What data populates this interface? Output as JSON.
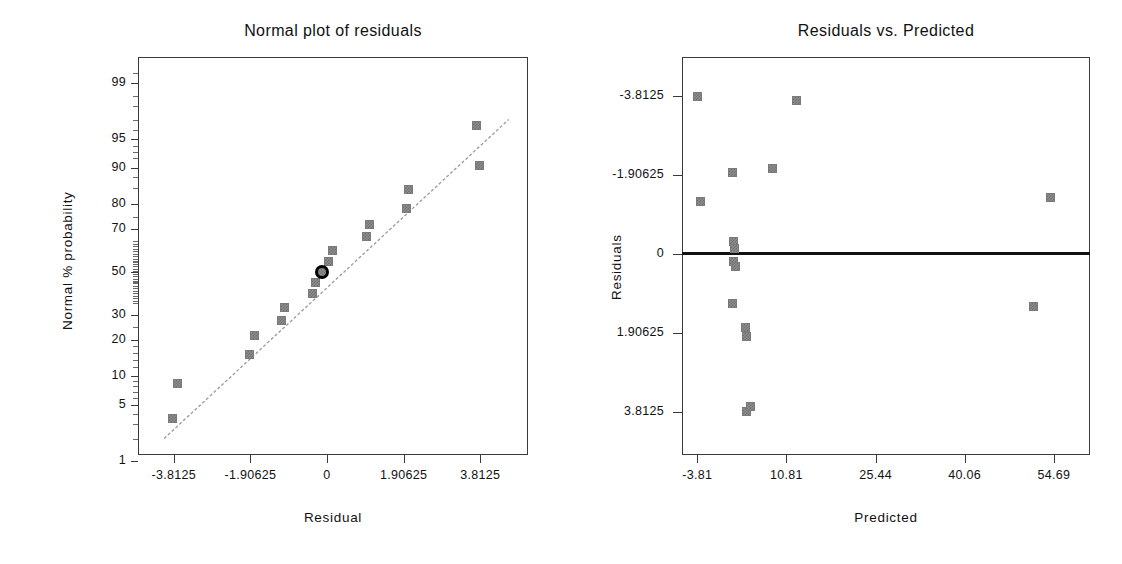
{
  "figure": {
    "width": 1122,
    "height": 564,
    "background": "#ffffff",
    "marker_color": "#8e8e8e",
    "line_color": "#999999",
    "axis_color": "#3a3a3a",
    "highlight_color": "#000000"
  },
  "chart_data": [
    {
      "type": "scatter",
      "title": "Normal plot of residuals",
      "xlabel": "Residual",
      "ylabel": "Normal % probability",
      "grid": false,
      "legend": null,
      "xlim": [
        -4.7,
        5.0
      ],
      "xticks": [
        -3.8125,
        -1.90625,
        0,
        1.90625,
        3.8125
      ],
      "xticklabels": [
        "-3.8125",
        "-1.90625",
        "0",
        "1.90625",
        "3.8125"
      ],
      "yscale": "normal-probability",
      "yticks": [
        1,
        5,
        10,
        20,
        30,
        50,
        70,
        80,
        90,
        95,
        99
      ],
      "yticklabels": [
        "1",
        "5",
        "10",
        "20",
        "30",
        "50",
        "70",
        "80",
        "90",
        "95",
        "99"
      ],
      "points": [
        {
          "x": -3.83,
          "y": 3.5
        },
        {
          "x": -3.72,
          "y": 8.5
        },
        {
          "x": -1.93,
          "y": 15.5
        },
        {
          "x": -1.8,
          "y": 21.5
        },
        {
          "x": -1.13,
          "y": 27.5
        },
        {
          "x": -1.05,
          "y": 33.0
        },
        {
          "x": -0.35,
          "y": 39.5
        },
        {
          "x": -0.28,
          "y": 45.0
        },
        {
          "x": -0.12,
          "y": 50.0
        },
        {
          "x": 0.05,
          "y": 55.0
        },
        {
          "x": 0.14,
          "y": 60.5
        },
        {
          "x": 0.98,
          "y": 67.0
        },
        {
          "x": 1.05,
          "y": 72.0
        },
        {
          "x": 1.98,
          "y": 78.5
        },
        {
          "x": 2.04,
          "y": 84.5
        },
        {
          "x": 3.8,
          "y": 90.5
        },
        {
          "x": 3.72,
          "y": 96.5
        }
      ],
      "highlighted_point": {
        "x": -0.12,
        "y": 50.0
      },
      "reference_line": {
        "x1": -4.05,
        "y1": 2.0,
        "x2": 4.52,
        "y2": 97.0,
        "style": "dashed"
      }
    },
    {
      "type": "scatter",
      "title": "Residuals vs. Predicted",
      "xlabel": "Predicted",
      "ylabel": "Residuals",
      "grid": false,
      "legend": null,
      "xlim": [
        -6.3,
        60.6
      ],
      "xticks": [
        -3.81,
        10.81,
        25.44,
        40.06,
        54.69
      ],
      "xticklabels": [
        "-3.81",
        "10.81",
        "25.44",
        "40.06",
        "54.69"
      ],
      "ylim": [
        -4.85,
        4.75
      ],
      "yticks": [
        -3.8125,
        -1.90625,
        0,
        1.90625,
        3.8125
      ],
      "yticklabels": [
        "-3.8125",
        "-1.90625",
        "0",
        "1.90625",
        "3.8125"
      ],
      "zero_line": 0,
      "points": [
        {
          "x": -3.8,
          "y": 3.8
        },
        {
          "x": -3.25,
          "y": 1.27
        },
        {
          "x": 1.95,
          "y": 1.97
        },
        {
          "x": 2.2,
          "y": 0.3
        },
        {
          "x": 2.3,
          "y": 0.14
        },
        {
          "x": 2.15,
          "y": -0.18
        },
        {
          "x": 2.45,
          "y": -0.3
        },
        {
          "x": 2.05,
          "y": -1.2
        },
        {
          "x": 4.05,
          "y": -1.78
        },
        {
          "x": 4.3,
          "y": -1.98
        },
        {
          "x": 4.35,
          "y": -3.8
        },
        {
          "x": 4.95,
          "y": -3.68
        },
        {
          "x": 8.55,
          "y": 2.05
        },
        {
          "x": 12.4,
          "y": 3.7
        },
        {
          "x": 54.1,
          "y": 1.35
        },
        {
          "x": 51.4,
          "y": -1.26
        }
      ]
    }
  ],
  "left": {
    "title": "Normal plot of residuals",
    "xlabel": "Residual",
    "ylabel": "Normal % probability",
    "xticklabels": [
      "-3.8125",
      "-1.90625",
      "0",
      "1.90625",
      "3.8125"
    ],
    "yticklabels": [
      "99",
      "95",
      "90",
      "80",
      "70",
      "50",
      "30",
      "20",
      "10",
      "5",
      "1"
    ]
  },
  "right": {
    "title": "Residuals vs. Predicted",
    "xlabel": "Predicted",
    "ylabel": "Residuals",
    "xticklabels": [
      "-3.81",
      "10.81",
      "25.44",
      "40.06",
      "54.69"
    ],
    "yticklabels": [
      "3.8125",
      "1.90625",
      "0",
      "-1.90625",
      "-3.8125"
    ]
  }
}
